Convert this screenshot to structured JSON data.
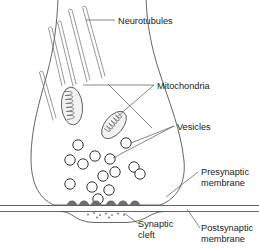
{
  "figure": {
    "width": 259,
    "height": 249,
    "background_color": "#ffffff",
    "line_color": "#555555",
    "text_color": "#1a1a1a"
  },
  "labels": {
    "neurotubules": "Neurotubules",
    "mitochondria": "Mitochondria",
    "vesicles": "Vesicles",
    "presynaptic_membrane_line1": "Presynaptic",
    "presynaptic_membrane_line2": "membrane",
    "synaptic_cleft_line1": "Synaptic",
    "synaptic_cleft_line2": "cleft",
    "postsynaptic_membrane_line1": "Postsynaptic",
    "postsynaptic_membrane_line2": "membrane"
  },
  "structures": {
    "terminal_outline": "M 58,0 C 56,26 52,50 44,78 C 36,104 30,130 30,160 C 30,184 36,198 50,204 L 160,204 C 178,198 186,182 184,162 C 182,132 170,104 160,74 C 150,46 146,22 145,0",
    "neurotubules": [
      {
        "x1": 48,
        "y1": 26,
        "x2": 62,
        "y2": 84
      },
      {
        "x1": 53,
        "y1": 26,
        "x2": 67,
        "y2": 84
      },
      {
        "x1": 58,
        "y1": 20,
        "x2": 74,
        "y2": 82
      },
      {
        "x1": 63,
        "y1": 20,
        "x2": 79,
        "y2": 82
      },
      {
        "x1": 70,
        "y1": 9,
        "x2": 88,
        "y2": 80
      },
      {
        "x1": 75,
        "y1": 9,
        "x2": 93,
        "y2": 80
      },
      {
        "x1": 83,
        "y1": 6,
        "x2": 101,
        "y2": 78
      },
      {
        "x1": 88,
        "y1": 6,
        "x2": 106,
        "y2": 78
      }
    ],
    "mitochondria": [
      {
        "cx": 72,
        "cy": 106,
        "rx": 11,
        "ry": 19,
        "rotation": -4,
        "cristae": 7
      },
      {
        "cx": 114,
        "cy": 125,
        "rx": 9,
        "ry": 16,
        "rotation": 38,
        "cristae": 6
      }
    ],
    "vesicles": [
      {
        "cx": 78,
        "cy": 145,
        "r": 5.2
      },
      {
        "cx": 70,
        "cy": 160,
        "r": 5.2
      },
      {
        "cx": 95,
        "cy": 156,
        "r": 5.2
      },
      {
        "cx": 83,
        "cy": 164,
        "r": 5.2
      },
      {
        "cx": 110,
        "cy": 159,
        "r": 5.2
      },
      {
        "cx": 126,
        "cy": 143,
        "r": 5.2
      },
      {
        "cx": 115,
        "cy": 172,
        "r": 5.2
      },
      {
        "cx": 103,
        "cy": 176,
        "r": 5.2
      },
      {
        "cx": 134,
        "cy": 167,
        "r": 5.2
      },
      {
        "cx": 92,
        "cy": 187,
        "r": 5.2
      },
      {
        "cx": 109,
        "cy": 190,
        "r": 5.2
      },
      {
        "cx": 70,
        "cy": 184,
        "r": 5.2
      },
      {
        "cx": 140,
        "cy": 174,
        "r": 5.2
      },
      {
        "cx": 98,
        "cy": 199,
        "r": 5.2
      }
    ],
    "active_zone_densities": [
      {
        "cx": 72,
        "cy": 204,
        "w": 9,
        "h": 7
      },
      {
        "cx": 84,
        "cy": 204,
        "w": 9,
        "h": 7
      },
      {
        "cx": 96,
        "cy": 204,
        "w": 9,
        "h": 7
      },
      {
        "cx": 110,
        "cy": 204,
        "w": 9,
        "h": 7
      },
      {
        "cx": 122,
        "cy": 204,
        "w": 9,
        "h": 7
      },
      {
        "cx": 134,
        "cy": 204,
        "w": 9,
        "h": 7
      }
    ],
    "cleft_dots": [
      {
        "cx": 88,
        "cy": 214,
        "r": 0.9
      },
      {
        "cx": 94,
        "cy": 212,
        "r": 0.9
      },
      {
        "cx": 100,
        "cy": 214,
        "r": 0.9
      },
      {
        "cx": 106,
        "cy": 212,
        "r": 0.9
      },
      {
        "cx": 112,
        "cy": 214,
        "r": 0.9
      },
      {
        "cx": 118,
        "cy": 213,
        "r": 0.9
      },
      {
        "cx": 124,
        "cy": 214,
        "r": 0.9
      },
      {
        "cx": 97,
        "cy": 217,
        "r": 0.9
      },
      {
        "cx": 109,
        "cy": 217,
        "r": 0.9
      }
    ],
    "presynaptic_membrane_path": "M 0,205.5 L 259,205.5",
    "postsynaptic_membrane_path": "M 0,211.5 L 259,211.5",
    "cleft_floor_path": "M 0,211.5 L 62,211.5 C 76,211.5 76,222 98,222 L 122,222 C 146,222 150,211.5 166,211.5 L 259,211.5"
  },
  "leaders": {
    "neurotubules": "M 86,20 L 115,20",
    "mitochondria_upper": "M 83,84 L 155,85",
    "mitochondria_lower": "M 116,112 L 155,85",
    "mitochondria_cross_a": "M 111,88 L 150,128",
    "mitochondria_cross_b": "M 150,84 L 108,128",
    "vesicles_upper": "M 131,142 L 174,126",
    "vesicles_lower": "M 114,158 L 174,126",
    "presynaptic": "M 167,196 L 198,172",
    "synaptic_cleft": "M 124,213 L 140,224",
    "postsynaptic": "M 186,208 L 200,228"
  }
}
